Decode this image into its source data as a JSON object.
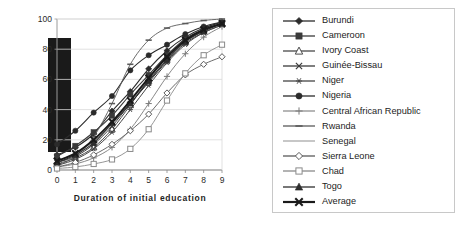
{
  "chart_data": {
    "type": "line",
    "title": "",
    "xlabel": "Duration of initial education",
    "ylabel": "",
    "xlim": [
      0,
      9
    ],
    "ylim": [
      0,
      100
    ],
    "x": [
      0,
      1,
      2,
      3,
      4,
      5,
      6,
      7,
      8,
      9
    ],
    "xticks": [
      "0",
      "1",
      "2",
      "3",
      "4",
      "5",
      "6",
      "7",
      "8",
      "9"
    ],
    "yticks": [
      "0",
      "20",
      "40",
      "60",
      "80",
      "100"
    ],
    "grid": true,
    "legend_position": "right",
    "series": [
      {
        "name": "Burundi",
        "marker": "filled-diamond",
        "color": "#2b2b2b",
        "width": 1.1,
        "values": [
          10,
          15,
          24,
          39,
          52,
          67,
          79,
          88,
          94,
          98
        ]
      },
      {
        "name": "Cameroon",
        "marker": "filled-square",
        "color": "#3a3a3a",
        "width": 1.1,
        "values": [
          9,
          16,
          25,
          36,
          50,
          63,
          76,
          87,
          93,
          97
        ]
      },
      {
        "name": "Ivory Coast",
        "marker": "open-triangle",
        "color": "#4a4a4a",
        "width": 1.0,
        "values": [
          4,
          8,
          15,
          27,
          43,
          60,
          74,
          85,
          92,
          97
        ]
      },
      {
        "name": "Guinée-Bissau",
        "marker": "x-cross",
        "color": "#3a3a3a",
        "width": 1.0,
        "values": [
          5,
          9,
          17,
          29,
          44,
          58,
          72,
          84,
          91,
          96
        ]
      },
      {
        "name": "Niger",
        "marker": "asterisk",
        "color": "#454545",
        "width": 1.0,
        "values": [
          3,
          7,
          14,
          25,
          40,
          56,
          71,
          83,
          91,
          96
        ]
      },
      {
        "name": "Nigeria",
        "marker": "filled-circle",
        "color": "#2b2b2b",
        "width": 1.1,
        "values": [
          17,
          26,
          38,
          49,
          66,
          76,
          83,
          90,
          95,
          98
        ]
      },
      {
        "name": "Central African Republic",
        "marker": "plus",
        "color": "#7b7b7b",
        "width": 0.9,
        "values": [
          2,
          4,
          8,
          15,
          27,
          44,
          62,
          77,
          88,
          95
        ]
      },
      {
        "name": "Rwanda",
        "marker": "dash",
        "color": "#5a5a5a",
        "width": 0.9,
        "values": [
          3,
          9,
          22,
          44,
          70,
          86,
          94,
          97,
          99,
          100
        ]
      },
      {
        "name": "Senegal",
        "marker": "line",
        "color": "#9a9a9a",
        "width": 0.9,
        "values": [
          6,
          11,
          19,
          30,
          45,
          59,
          73,
          85,
          92,
          97
        ]
      },
      {
        "name": "Sierra Leone",
        "marker": "open-diamond",
        "color": "#5a5a5a",
        "width": 0.9,
        "values": [
          2,
          5,
          10,
          17,
          26,
          37,
          51,
          63,
          70,
          75
        ]
      },
      {
        "name": "Chad",
        "marker": "open-square",
        "color": "#8a8a8a",
        "width": 0.9,
        "values": [
          1,
          2,
          4,
          7,
          14,
          27,
          46,
          64,
          76,
          83
        ]
      },
      {
        "name": "Togo",
        "marker": "filled-triangle",
        "color": "#2e2e2e",
        "width": 1.1,
        "values": [
          5,
          10,
          18,
          31,
          44,
          59,
          73,
          85,
          92,
          97
        ]
      },
      {
        "name": "Average",
        "marker": "bold-x",
        "color": "#1a1a1a",
        "width": 1.9,
        "values": [
          6,
          11,
          20,
          32,
          46,
          61,
          75,
          86,
          93,
          97
        ]
      }
    ]
  },
  "axis": {
    "x_title": "Duration of initial education"
  },
  "legend": {
    "entries": [
      "Burundi",
      "Cameroon",
      "Ivory Coast",
      "Guinée-Bissau",
      "Niger",
      "Nigeria",
      "Central African Republic",
      "Rwanda",
      "Senegal",
      "Sierra Leone",
      "Chad",
      "Togo",
      "Average"
    ]
  }
}
